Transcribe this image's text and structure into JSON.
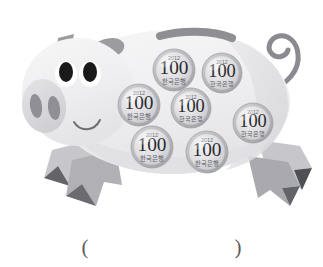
{
  "page": {
    "kind": "worksheet-illustration",
    "background_color": "#ffffff"
  },
  "illustration": {
    "subject": "piggy-bank-with-coins",
    "body_color": "#f2f2f3",
    "body_shadow_color": "#e2e2e4",
    "body_outline_color": "#e6e6e8",
    "accent_gray": "#9a9a9e",
    "dark_gray": "#6f6f74",
    "snout_color": "#dcdcdf",
    "nostril_color": "#8f8f95",
    "eye_color": "#1a1a1a",
    "eye_white_color": "#ffffff",
    "slot_color": "#8e8e93",
    "tail_color": "#8a8a90",
    "leg_light": "#c9c9cd",
    "leg_mid": "#a8a8ad",
    "leg_dark": "#5a5a60"
  },
  "coins": {
    "count": 7,
    "denomination": "100",
    "year": "2012",
    "currency_text": "한국은행",
    "rim_color": "#b9b9bd",
    "face_color": "#dedee1",
    "face_highlight": "#f0f0f2",
    "text_color": "#2b2b2e",
    "items": [
      {
        "id": "coin-1",
        "denomination": "100",
        "year": "2012",
        "currency_text": "한국은행",
        "cx": 174,
        "cy": 70,
        "r": 21
      },
      {
        "id": "coin-2",
        "denomination": "100",
        "year": "2012",
        "currency_text": "한국은행",
        "cx": 222,
        "cy": 73,
        "r": 20
      },
      {
        "id": "coin-3",
        "denomination": "100",
        "year": "2012",
        "currency_text": "한국은행",
        "cx": 139,
        "cy": 105,
        "r": 21
      },
      {
        "id": "coin-4",
        "denomination": "100",
        "year": "2012",
        "currency_text": "한국은행",
        "cx": 191,
        "cy": 108,
        "r": 20
      },
      {
        "id": "coin-5",
        "denomination": "100",
        "year": "2012",
        "currency_text": "한국은행",
        "cx": 253,
        "cy": 123,
        "r": 20
      },
      {
        "id": "coin-6",
        "denomination": "100",
        "year": "2012",
        "currency_text": "한국은행",
        "cx": 152,
        "cy": 147,
        "r": 21
      },
      {
        "id": "coin-7",
        "denomination": "100",
        "year": "2012",
        "currency_text": "한국은행",
        "cx": 207,
        "cy": 152,
        "r": 21
      }
    ]
  },
  "answer": {
    "open_paren": "(",
    "close_paren": ")",
    "value": ""
  }
}
